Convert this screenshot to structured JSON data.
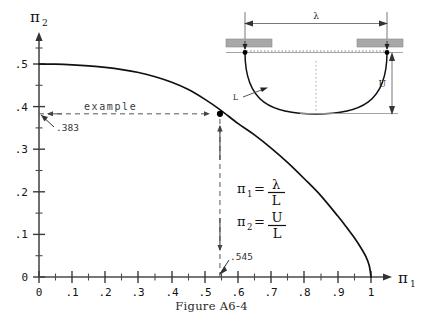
{
  "figure": {
    "caption": "Figure A6-4",
    "axis_x_name": "π",
    "axis_x_sub": "1",
    "axis_y_name": "π",
    "axis_y_sub": "2"
  },
  "formulas": {
    "f1_lhs": "π",
    "f1_sub": "1",
    "f1_eq": "=",
    "f1_num": "λ",
    "f1_den": "L",
    "f2_lhs": "π",
    "f2_sub": "2",
    "f2_eq": "=",
    "f2_num": "U",
    "f2_den": "L"
  },
  "annotations": {
    "example_label": "example",
    "y_value_label": ".383",
    "x_value_label": ".545"
  },
  "inset": {
    "span_label": "λ",
    "sag_label": "U",
    "cable_label": "L"
  },
  "colors": {
    "curve": "#111111",
    "axis": "#4a4a4a",
    "dashed": "#555555",
    "support_fill": "#a8a8a8",
    "inset_line": "#8c8c8c",
    "point": "#000000"
  },
  "chart_data": {
    "type": "line",
    "title": "Figure A6-4",
    "xlabel": "π₁ = λ/L",
    "ylabel": "π₂ = U/L",
    "xlim": [
      0,
      1
    ],
    "ylim": [
      0,
      0.5
    ],
    "grid": false,
    "legend": null,
    "x_ticks": [
      "0",
      ".1",
      ".2",
      ".3",
      ".4",
      ".5",
      ".6",
      ".7",
      ".8",
      ".9",
      "1"
    ],
    "x_tick_values": [
      0,
      0.1,
      0.2,
      0.3,
      0.4,
      0.5,
      0.6,
      0.7,
      0.8,
      0.9,
      1.0
    ],
    "y_ticks": [
      "0",
      ".1",
      ".2",
      ".3",
      ".4",
      ".5"
    ],
    "y_tick_values": [
      0,
      0.1,
      0.2,
      0.3,
      0.4,
      0.5
    ],
    "minor_ticks": true,
    "series": [
      {
        "name": "π₂ vs π₁",
        "x": [
          0.0,
          0.05,
          0.1,
          0.15,
          0.2,
          0.25,
          0.3,
          0.35,
          0.4,
          0.45,
          0.5,
          0.545,
          0.6,
          0.65,
          0.7,
          0.75,
          0.8,
          0.85,
          0.9,
          0.93,
          0.95,
          0.97,
          0.985,
          0.995,
          1.0
        ],
        "y": [
          0.5,
          0.4995,
          0.498,
          0.4955,
          0.492,
          0.487,
          0.48,
          0.47,
          0.457,
          0.44,
          0.417,
          0.393,
          0.36,
          0.333,
          0.302,
          0.268,
          0.23,
          0.19,
          0.143,
          0.113,
          0.092,
          0.068,
          0.047,
          0.026,
          0.0
        ]
      }
    ],
    "annotated_point": {
      "x": 0.545,
      "y": 0.383,
      "label": "example"
    },
    "annotation_values": {
      "x": ".545",
      "y": ".383"
    }
  }
}
